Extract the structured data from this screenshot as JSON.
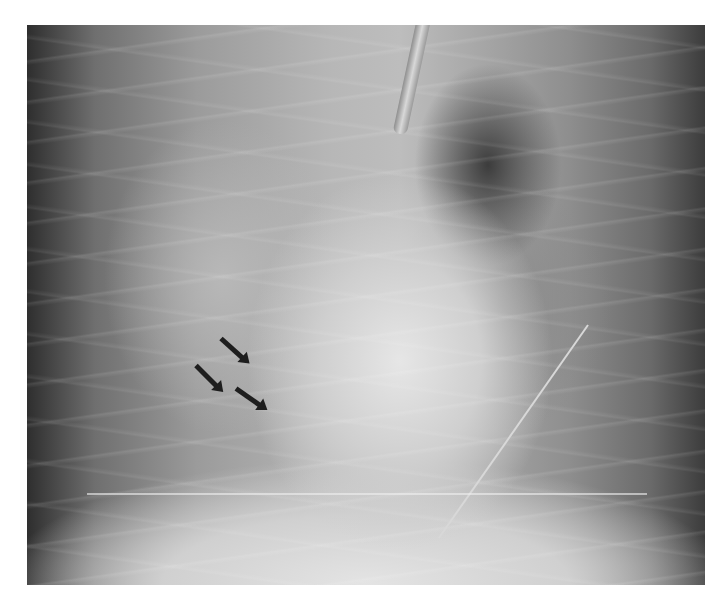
{
  "image": {
    "type": "chest radiograph (frontal view)",
    "background_color": "#ffffff",
    "frame": {
      "x": 27,
      "y": 25,
      "width": 678,
      "height": 560
    },
    "annotations": [
      {
        "kind": "arrow",
        "direction": "down-right",
        "x": 221,
        "y": 336
      },
      {
        "kind": "arrow",
        "direction": "down-right",
        "x": 196,
        "y": 363
      },
      {
        "kind": "arrow",
        "direction": "down-right",
        "x": 236,
        "y": 386
      }
    ],
    "features": [
      "endotracheal tube",
      "wire/line on right lower field",
      "arrows marking opacity in right lower lung"
    ]
  }
}
